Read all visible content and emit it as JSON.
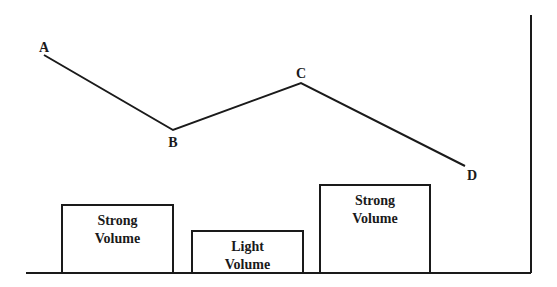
{
  "diagram": {
    "type": "price-volume-diagram",
    "colors": {
      "stroke": "#1a1a1a",
      "background": "#ffffff"
    },
    "price_points": [
      {
        "label": "A",
        "x": 44,
        "y": 55,
        "label_x": 44,
        "label_y": 52
      },
      {
        "label": "B",
        "x": 173,
        "y": 130,
        "label_x": 173,
        "label_y": 147
      },
      {
        "label": "C",
        "x": 301,
        "y": 83,
        "label_x": 301,
        "label_y": 78
      },
      {
        "label": "D",
        "x": 465,
        "y": 166,
        "label_x": 472,
        "label_y": 180
      }
    ],
    "volume_bars": [
      {
        "line1": "Strong",
        "line2": "Volume",
        "x": 62,
        "width": 111,
        "top": 205
      },
      {
        "line1": "Light",
        "line2": "Volume",
        "x": 192,
        "width": 111,
        "top": 231
      },
      {
        "line1": "Strong",
        "line2": "Volume",
        "x": 320,
        "width": 110,
        "top": 185
      }
    ],
    "baseline": {
      "x1": 26,
      "x2": 531,
      "y": 273
    },
    "vertical_axis": {
      "x": 531,
      "y1": 15,
      "y2": 273
    }
  }
}
